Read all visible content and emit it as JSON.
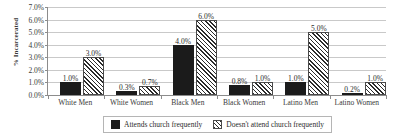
{
  "chart_data": {
    "type": "bar",
    "title": "",
    "xlabel": "",
    "ylabel": "% Incarcerated",
    "ylim": [
      0,
      7
    ],
    "ytick_labels": [
      "0.0%",
      "1.0%",
      "2.0%",
      "3.0%",
      "4.0%",
      "5.0%",
      "6.0%",
      "7.0%"
    ],
    "ytick_values": [
      0,
      1,
      2,
      3,
      4,
      5,
      6,
      7
    ],
    "grid": true,
    "legend_position": "bottom-center",
    "categories": [
      "White Men",
      "White Women",
      "Black Men",
      "Black Women",
      "Latino Men",
      "Latino Women"
    ],
    "series": [
      {
        "name": "Attends church frequently",
        "style": "solid",
        "color": "#1b1b1b",
        "values": [
          1.0,
          0.3,
          4.0,
          0.8,
          1.0,
          0.2
        ],
        "labels": [
          "1.0%",
          "0.3%",
          "4.0%",
          "0.8%",
          "1.0%",
          "0.2%"
        ]
      },
      {
        "name": "Doesn't attend church frequently",
        "style": "hatched",
        "color": "#2b2b2b",
        "values": [
          3.0,
          0.7,
          6.0,
          1.0,
          5.0,
          1.0
        ],
        "labels": [
          "3.0%",
          "0.7%",
          "6.0%",
          "1.0%",
          "5.0%",
          "1.0%"
        ]
      }
    ]
  },
  "legend": {
    "entries": [
      {
        "label": "Attends church frequently"
      },
      {
        "label": "Doesn't attend church frequently"
      }
    ]
  }
}
